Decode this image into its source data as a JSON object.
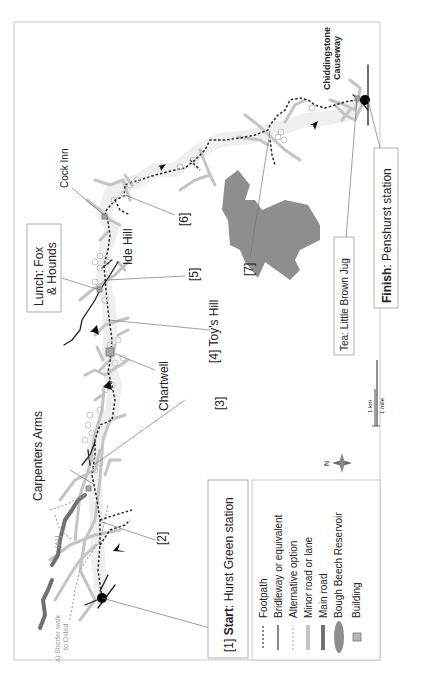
{
  "map": {
    "orientation": "rotated 90 degrees counter-clockwise",
    "start_label": {
      "prefix": "[1] ",
      "bold": "Start",
      "rest": ": Hurst Green station"
    },
    "finish_label": {
      "bold": "Finish",
      "rest": ": Penshurst station"
    },
    "lunch_label": {
      "line1": "Lunch: Fox",
      "line2": "& Hounds"
    },
    "tea_label": "Tea: Little Brown Jug",
    "places": {
      "cock_inn": "Cock Inn",
      "ide_hill": "Ide Hill",
      "chartwell": "Chartwell",
      "carpenters_arms": "Carpenters Arms",
      "chiddingstone_1": "Chiddingstone",
      "chiddingstone_2": "Causeway",
      "toys_hill": "[4] Toy's Hill",
      "a1_road": "[A1]",
      "shorter_walk_1": "a) Shorter walk",
      "shorter_walk_2": "to Oxted"
    },
    "waypoints": [
      "[2]",
      "[3]",
      "[5]",
      "[6]",
      "[7]"
    ],
    "compass": "N",
    "scale": {
      "km": "1 km",
      "mile": "1 mile"
    },
    "legend": {
      "items": [
        {
          "symbol": "dotted-dark",
          "label": "Footpath"
        },
        {
          "symbol": "solid-dark",
          "label": "Bridleway or equivalent"
        },
        {
          "symbol": "dotted-light",
          "label": "Alternative option"
        },
        {
          "symbol": "thick-light-gray",
          "label": "Minor road or lane"
        },
        {
          "symbol": "thick-dark-gray",
          "label": "Main road"
        },
        {
          "symbol": "gray-ellipse",
          "label": "Bough Beech Reservoir"
        },
        {
          "symbol": "gray-square",
          "label": "Building"
        }
      ]
    },
    "colors": {
      "footpath": "#333333",
      "minor_road": "#bdbdbd",
      "main_road": "#707070",
      "reservoir": "#8c8c8c",
      "building": "#a8a8a8",
      "frame": "#bdbdbd",
      "route_halo": "#ececec"
    }
  }
}
